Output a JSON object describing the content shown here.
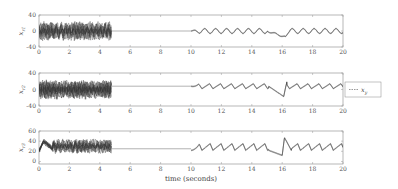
{
  "chart_data": [
    {
      "type": "line",
      "ylabel": "x_{r1}",
      "xlabel": "",
      "xlim": [
        0,
        20
      ],
      "ylim": [
        -40,
        40
      ],
      "xticks": [
        0,
        2,
        4,
        6,
        8,
        10,
        12,
        14,
        16,
        18,
        20
      ],
      "yticks": [
        -40,
        0,
        40
      ],
      "description": "Dense multi-trajectory oscillations between about -25 and 25 from t=0 to t≈4.8, flat at 0 from 4.8 to 10, then small periodic oscillation (~±6) from 10 to 20 with a dip to about -15 at t≈16",
      "segments": [
        {
          "t": [
            0,
            4.8
          ],
          "behavior": "dense noisy bundle",
          "range": [
            -25,
            25
          ]
        },
        {
          "t": [
            4.8,
            10
          ],
          "behavior": "flat",
          "value": 0
        },
        {
          "t": [
            10,
            20
          ],
          "behavior": "periodic oscillation",
          "amplitude": 6,
          "dip": {
            "t": 16,
            "value": -15
          }
        }
      ]
    },
    {
      "type": "line",
      "ylabel": "x_{r2}",
      "xlabel": "",
      "xlim": [
        0,
        20
      ],
      "ylim": [
        -40,
        40
      ],
      "xticks": [
        0,
        2,
        4,
        6,
        8,
        10,
        12,
        14,
        16,
        18,
        20
      ],
      "yticks": [
        -40,
        0,
        40
      ],
      "description": "Dense multi-trajectory oscillations between about -25 and 25 from t=0 to 4.8, flat at ~8 from 4.8 to 10, then sawtooth-like periodic oscillation from 10 to 20 with dip near t≈16",
      "segments": [
        {
          "t": [
            0,
            4.8
          ],
          "behavior": "dense noisy bundle",
          "range": [
            -25,
            25
          ]
        },
        {
          "t": [
            4.8,
            10
          ],
          "behavior": "flat",
          "value": 8
        },
        {
          "t": [
            10,
            20
          ],
          "behavior": "periodic oscillation",
          "amplitude": 12,
          "dip": {
            "t": 16,
            "value": -20
          }
        }
      ],
      "legend": {
        "entries": [
          "x_y"
        ],
        "style": "dashed",
        "position": "right outside"
      }
    },
    {
      "type": "line",
      "ylabel": "x_{r3}",
      "xlabel": "time (seconds)",
      "xlim": [
        0,
        20
      ],
      "ylim": [
        -5,
        60
      ],
      "xticks": [
        0,
        2,
        4,
        6,
        8,
        10,
        12,
        14,
        16,
        18,
        20
      ],
      "yticks": [
        0,
        20,
        40,
        60
      ],
      "description": "Initial spike to ~45, dense bundle 15–45 from t=0 to 4.8, flat at ~25 from 4.8 to 10, then periodic peaks ~35 from 10 to 20 with peak ~47 at t≈16",
      "segments": [
        {
          "t": [
            0,
            4.8
          ],
          "behavior": "dense noisy bundle",
          "range": [
            15,
            45
          ]
        },
        {
          "t": [
            4.8,
            10
          ],
          "behavior": "flat",
          "value": 25
        },
        {
          "t": [
            10,
            20
          ],
          "behavior": "periodic peaks",
          "baseline": 22,
          "peak": 35,
          "spike": {
            "t": 16,
            "value": 47
          }
        }
      ]
    }
  ],
  "plots": [
    {
      "ylabel_main": "x",
      "ylabel_sub": "r1",
      "yticks": [
        "40",
        "0",
        "-40"
      ]
    },
    {
      "ylabel_main": "x",
      "ylabel_sub": "r2",
      "yticks": [
        "40",
        "0",
        "-40"
      ]
    },
    {
      "ylabel_main": "x",
      "ylabel_sub": "r3",
      "yticks": [
        "60",
        "40",
        "20",
        "0"
      ]
    }
  ],
  "xticks": [
    "0",
    "2",
    "4",
    "6",
    "8",
    "10",
    "12",
    "14",
    "16",
    "18",
    "20"
  ],
  "xlabel": "time (seconds)",
  "legend": {
    "label_main": "x",
    "label_sub": "y"
  },
  "colors": {
    "line": "#333333",
    "frame": "#888888",
    "text": "#555555"
  }
}
